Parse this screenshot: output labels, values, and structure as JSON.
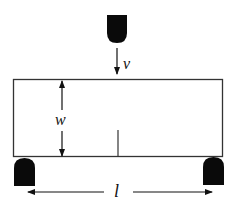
{
  "diagram": {
    "labels": {
      "velocity": "v",
      "width": "w",
      "span": "l"
    },
    "elements": {
      "loader": "Striker (top loading nose)",
      "specimen": "Beam specimen with notch",
      "supports": [
        "Left support",
        "Right support"
      ]
    },
    "colors": {
      "stroke": "#111111",
      "fill": "#0a0a0a",
      "background": "#ffffff"
    }
  }
}
